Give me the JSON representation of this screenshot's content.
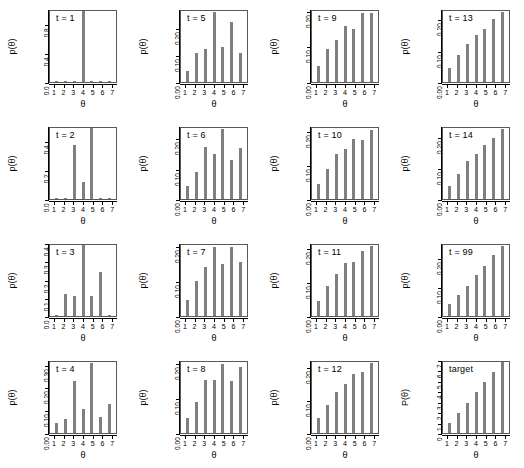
{
  "figure": {
    "axis_x_title": "θ",
    "bar_color": "#7f7f7f",
    "axis_color": "#000000",
    "x_categories": [
      "1",
      "2",
      "3",
      "4",
      "5",
      "6",
      "7"
    ]
  },
  "chart_data": {
    "type": "bar",
    "title": "",
    "xlabel": "θ",
    "grid": false,
    "legend": "none",
    "layout": {
      "rows": 4,
      "cols": 4,
      "order": "column-major"
    },
    "panels": [
      {
        "label": "t = 1",
        "ylabel": "p(θ)",
        "categories": [
          "1",
          "2",
          "3",
          "4",
          "5",
          "6",
          "7"
        ],
        "values": [
          0.0,
          0.0,
          0.0,
          1.0,
          0.0,
          0.0,
          0.0
        ],
        "ylim": [
          0.0,
          1.0
        ],
        "yticks": [
          0.0,
          0.4,
          0.8
        ],
        "yticklabels": [
          "0.0",
          "0.4",
          "0.8"
        ]
      },
      {
        "label": "t = 2",
        "ylabel": "p(θ)",
        "categories": [
          "1",
          "2",
          "3",
          "4",
          "5",
          "6",
          "7"
        ],
        "values": [
          0.0,
          0.0,
          0.38,
          0.12,
          0.5,
          0.0,
          0.0
        ],
        "ylim": [
          0.0,
          0.5
        ],
        "yticks": [
          0.0,
          0.2,
          0.4
        ],
        "yticklabels": [
          "0.0",
          "0.2",
          "0.4"
        ]
      },
      {
        "label": "t = 3",
        "ylabel": "p(θ)",
        "categories": [
          "1",
          "2",
          "3",
          "4",
          "5",
          "6",
          "7"
        ],
        "values": [
          0.0,
          0.125,
          0.11,
          0.4,
          0.115,
          0.25,
          0.0
        ],
        "ylim": [
          0.0,
          0.4
        ],
        "yticks": [
          0.0,
          0.1,
          0.2,
          0.3,
          0.4
        ],
        "yticklabels": [
          "0.0",
          "0.1",
          "0.2",
          "0.3",
          "0.4"
        ]
      },
      {
        "label": "t = 4",
        "ylabel": "p(θ)",
        "categories": [
          "1",
          "2",
          "3",
          "4",
          "5",
          "6",
          "7"
        ],
        "values": [
          0.045,
          0.062,
          0.235,
          0.11,
          0.315,
          0.072,
          0.13
        ],
        "ylim": [
          0.0,
          0.32
        ],
        "yticks": [
          0.0,
          0.1,
          0.2,
          0.3
        ],
        "yticklabels": [
          "0.00",
          "0.10",
          "0.20",
          "0.30"
        ]
      },
      {
        "label": "t = 5",
        "ylabel": "p(θ)",
        "categories": [
          "1",
          "2",
          "3",
          "4",
          "5",
          "6",
          "7"
        ],
        "values": [
          0.042,
          0.112,
          0.125,
          0.265,
          0.135,
          0.23,
          0.112
        ],
        "ylim": [
          0.0,
          0.27
        ],
        "yticks": [
          0.0,
          0.1,
          0.2
        ],
        "yticklabels": [
          "0.00",
          "0.10",
          "0.20"
        ]
      },
      {
        "label": "t = 6",
        "ylabel": "p(θ)",
        "categories": [
          "1",
          "2",
          "3",
          "4",
          "5",
          "6",
          "7"
        ],
        "values": [
          0.043,
          0.092,
          0.175,
          0.152,
          0.238,
          0.133,
          0.173
        ],
        "ylim": [
          0.0,
          0.24
        ],
        "yticks": [
          0.0,
          0.1,
          0.2
        ],
        "yticklabels": [
          "0.00",
          "0.10",
          "0.20"
        ]
      },
      {
        "label": "t = 7",
        "ylabel": "p(θ)",
        "categories": [
          "1",
          "2",
          "3",
          "4",
          "5",
          "6",
          "7"
        ],
        "values": [
          0.047,
          0.105,
          0.145,
          0.205,
          0.155,
          0.205,
          0.16
        ],
        "ylim": [
          0.0,
          0.21
        ],
        "yticks": [
          0.0,
          0.1,
          0.2
        ],
        "yticklabels": [
          "0.00",
          "0.10",
          "0.20"
        ]
      },
      {
        "label": "t = 8",
        "ylabel": "p(θ)",
        "categories": [
          "1",
          "2",
          "3",
          "4",
          "5",
          "6",
          "7"
        ],
        "values": [
          0.045,
          0.092,
          0.157,
          0.158,
          0.205,
          0.155,
          0.195
        ],
        "ylim": [
          0.0,
          0.21
        ],
        "yticks": [
          0.0,
          0.1,
          0.2
        ],
        "yticklabels": [
          "0.00",
          "0.10",
          "0.20"
        ]
      },
      {
        "label": "t = 9",
        "ylabel": "p(θ)",
        "categories": [
          "1",
          "2",
          "3",
          "4",
          "5",
          "6",
          "7"
        ],
        "values": [
          0.045,
          0.095,
          0.122,
          0.162,
          0.152,
          0.2,
          0.2
        ],
        "ylim": [
          0.0,
          0.205
        ],
        "yticks": [
          0.0,
          0.1,
          0.2
        ],
        "yticklabels": [
          "0.00",
          "0.10",
          "0.20"
        ]
      },
      {
        "label": "t = 10",
        "ylabel": "p(θ)",
        "categories": [
          "1",
          "2",
          "3",
          "4",
          "5",
          "6",
          "7"
        ],
        "values": [
          0.045,
          0.09,
          0.135,
          0.15,
          0.182,
          0.178,
          0.21
        ],
        "ylim": [
          0.0,
          0.215
        ],
        "yticks": [
          0.0,
          0.1,
          0.2
        ],
        "yticklabels": [
          "0.00",
          "0.10",
          "0.20"
        ]
      },
      {
        "label": "t = 11",
        "ylabel": "p(θ)",
        "categories": [
          "1",
          "2",
          "3",
          "4",
          "5",
          "6",
          "7"
        ],
        "values": [
          0.045,
          0.09,
          0.127,
          0.16,
          0.165,
          0.196,
          0.212
        ],
        "ylim": [
          0.0,
          0.215
        ],
        "yticks": [
          0.0,
          0.1,
          0.2
        ],
        "yticklabels": [
          "0.00",
          "0.10",
          "0.20"
        ]
      },
      {
        "label": "t = 12",
        "ylabel": "p(θ)",
        "categories": [
          "1",
          "2",
          "3",
          "4",
          "5",
          "6",
          "7"
        ],
        "values": [
          0.048,
          0.088,
          0.128,
          0.152,
          0.184,
          0.19,
          0.218
        ],
        "ylim": [
          0.0,
          0.222
        ],
        "yticks": [
          0.0,
          0.1,
          0.2
        ],
        "yticklabels": [
          "0.00",
          "0.10",
          "0.20"
        ]
      },
      {
        "label": "t = 13",
        "ylabel": "p(θ)",
        "categories": [
          "1",
          "2",
          "3",
          "4",
          "5",
          "6",
          "7"
        ],
        "values": [
          0.046,
          0.087,
          0.125,
          0.152,
          0.174,
          0.205,
          0.228
        ],
        "ylim": [
          0.0,
          0.232
        ],
        "yticks": [
          0.0,
          0.1,
          0.2
        ],
        "yticklabels": [
          "0.00",
          "0.10",
          "0.20"
        ]
      },
      {
        "label": "t = 14",
        "ylabel": "p(θ)",
        "categories": [
          "1",
          "2",
          "3",
          "4",
          "5",
          "6",
          "7"
        ],
        "values": [
          0.044,
          0.084,
          0.125,
          0.148,
          0.177,
          0.2,
          0.23
        ],
        "ylim": [
          0.0,
          0.234
        ],
        "yticks": [
          0.0,
          0.1,
          0.2
        ],
        "yticklabels": [
          "0.00",
          "0.10",
          "0.20"
        ]
      },
      {
        "label": "t = 99",
        "ylabel": "p(θ)",
        "categories": [
          "1",
          "2",
          "3",
          "4",
          "5",
          "6",
          "7"
        ],
        "values": [
          0.043,
          0.075,
          0.108,
          0.145,
          0.178,
          0.215,
          0.25
        ],
        "ylim": [
          0.0,
          0.252
        ],
        "yticks": [
          0.0,
          0.1,
          0.2
        ],
        "yticklabels": [
          "0.00",
          "0.10",
          "0.20"
        ]
      },
      {
        "label": "target",
        "ylabel": "P(θ)",
        "categories": [
          "1",
          "2",
          "3",
          "4",
          "5",
          "6",
          "7"
        ],
        "values": [
          1,
          2,
          3,
          4,
          5,
          6,
          7
        ],
        "ylim": [
          0,
          7
        ],
        "yticks": [
          0,
          1,
          2,
          3,
          4,
          5,
          6,
          7
        ],
        "yticklabels": [
          "0",
          "1",
          "2",
          "3",
          "4",
          "5",
          "6",
          "7"
        ]
      }
    ]
  }
}
